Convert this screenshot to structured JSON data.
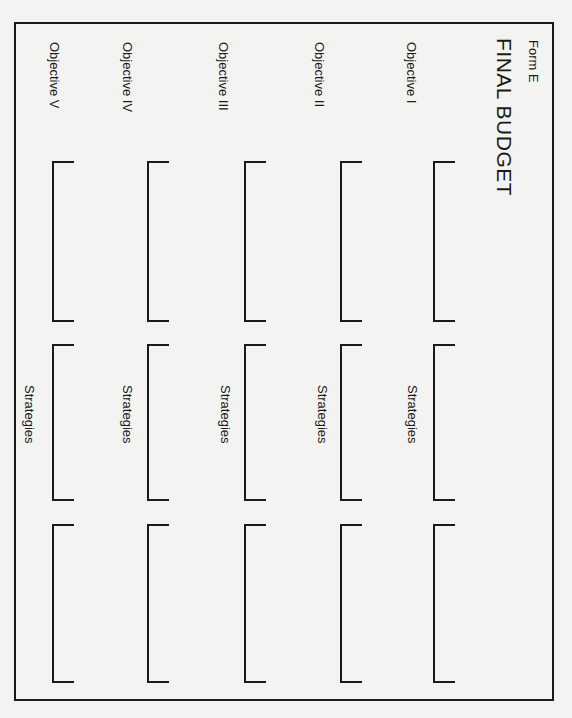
{
  "header": {
    "form_label": "Form E",
    "title": "FINAL BUDGET"
  },
  "columns": [
    {
      "objective": "Objective I",
      "strategies_label": "Strategies",
      "x": 433,
      "label_x": 405,
      "strat_x": 406
    },
    {
      "objective": "Objective II",
      "strategies_label": "Strategies",
      "x": 340,
      "label_x": 313,
      "strat_x": 316
    },
    {
      "objective": "Objective III",
      "strategies_label": "Strategies",
      "x": 244,
      "label_x": 217,
      "strat_x": 219
    },
    {
      "objective": "Objective IV",
      "strategies_label": "Strategies",
      "x": 147,
      "label_x": 121,
      "strat_x": 121
    },
    {
      "objective": "Objective V",
      "strategies_label": "Strategies",
      "x": 52,
      "label_x": 48,
      "strat_x": 23
    }
  ],
  "bracket_rows": [
    {
      "top": 161,
      "height": 161
    },
    {
      "top": 344,
      "height": 157
    },
    {
      "top": 524,
      "height": 159
    }
  ],
  "colors": {
    "paper": "#f3f3f1",
    "ink": "#1a1a1a"
  }
}
